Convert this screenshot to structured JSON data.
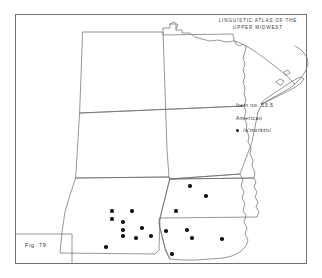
{
  "page": {
    "background_color": "#ffffff",
    "frame_color": "#6f6f6f",
    "ink_color": "#2f2f2f",
    "dot_color": "#141414"
  },
  "title": {
    "line1": "LINGUISTIC ATLAS OF THE",
    "line2": "UPPER MIDWEST"
  },
  "legend": {
    "item_number": "Item no. 53.5",
    "item_label": "American",
    "key_symbol": "legend-dot",
    "key_transcription": "/ə'mɛrkɪn/"
  },
  "caption": {
    "figure": "Fig. 79"
  },
  "chart_data": {
    "type": "scatter",
    "title": "LINGUISTIC ATLAS OF THE UPPER MIDWEST",
    "subtitle": "Item no. 53.5 — American",
    "xlabel": "",
    "ylabel": "",
    "legend_position": "right",
    "grid": false,
    "projection": "plate-outline",
    "region": "Upper Midwest, United States",
    "states_depicted": [
      "North Dakota",
      "South Dakota",
      "Nebraska",
      "Minnesota",
      "Iowa"
    ],
    "water_features": [
      "Lake Superior",
      "Lake of the Woods"
    ],
    "series": [
      {
        "name": "/ə'mɛrkɪn/",
        "marker": "filled-circle",
        "color": "#141414",
        "count": 18,
        "points": [
          {
            "x": 112,
            "y": 211,
            "state": "Nebraska"
          },
          {
            "x": 132,
            "y": 211,
            "state": "Nebraska"
          },
          {
            "x": 112,
            "y": 219,
            "state": "Nebraska"
          },
          {
            "x": 123,
            "y": 222,
            "state": "Nebraska"
          },
          {
            "x": 123,
            "y": 230,
            "state": "Nebraska"
          },
          {
            "x": 123,
            "y": 236,
            "state": "Nebraska"
          },
          {
            "x": 136,
            "y": 238,
            "state": "Nebraska"
          },
          {
            "x": 151,
            "y": 236,
            "state": "Nebraska"
          },
          {
            "x": 106,
            "y": 247,
            "state": "Nebraska"
          },
          {
            "x": 142,
            "y": 228,
            "state": "Nebraska"
          },
          {
            "x": 190,
            "y": 186,
            "state": "Iowa"
          },
          {
            "x": 206,
            "y": 196,
            "state": "Iowa"
          },
          {
            "x": 176,
            "y": 211,
            "state": "Iowa"
          },
          {
            "x": 166,
            "y": 231,
            "state": "Iowa"
          },
          {
            "x": 192,
            "y": 238,
            "state": "Iowa"
          },
          {
            "x": 222,
            "y": 239,
            "state": "Iowa"
          },
          {
            "x": 172,
            "y": 254,
            "state": "Iowa"
          },
          {
            "x": 187,
            "y": 230,
            "state": "Iowa"
          }
        ]
      }
    ]
  }
}
